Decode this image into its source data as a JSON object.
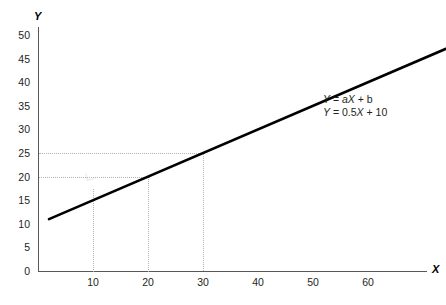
{
  "chart_data": {
    "type": "line",
    "title": "",
    "xlabel": "X",
    "ylabel": "Y",
    "xlim": [
      0,
      70
    ],
    "ylim": [
      0,
      50
    ],
    "grid": false,
    "x_ticks": [
      10,
      20,
      30,
      40,
      50,
      60
    ],
    "y_ticks": [
      0,
      5,
      10,
      15,
      20,
      25,
      30,
      35,
      40,
      45,
      50
    ],
    "series": [
      {
        "name": "Y = 0.5X + 10",
        "x": [
          2,
          76
        ],
        "values": [
          11,
          48
        ],
        "slope": 0.5,
        "intercept": 10,
        "color": "#000000"
      }
    ],
    "annotations": [
      {
        "text": "Y = aX + b"
      },
      {
        "text": "Y = 0.5X + 10"
      }
    ],
    "guides": {
      "vertical_x": [
        10,
        20,
        30
      ],
      "horizontal_y": [
        20,
        25
      ],
      "points": [
        {
          "x": 20,
          "y": 20
        },
        {
          "x": 30,
          "y": 25
        }
      ]
    }
  },
  "axes": {
    "y_title": "Y",
    "x_title": "X",
    "y_tick_labels": [
      "50",
      "45",
      "40",
      "35",
      "30",
      "25",
      "20",
      "15",
      "10",
      "5",
      "0"
    ],
    "x_tick_labels": [
      "10",
      "20",
      "30",
      "40",
      "50",
      "60"
    ]
  },
  "equation": {
    "line1_prefix": "Y",
    "line1_eq": " = ",
    "line1_a": "a",
    "line1_x": "X",
    "line1_suffix": " + b",
    "line2_prefix": "Y",
    "line2_eq": " = 0.5",
    "line2_x": "X",
    "line2_suffix": " + 10",
    "line1_full": "Y = aX + b",
    "line2_full": "Y = 0.5X + 10"
  },
  "colors": {
    "line": "#000000",
    "axis": "#58585a",
    "guide": "#b3b3b3",
    "text": "#231f20",
    "background": "#ffffff"
  }
}
